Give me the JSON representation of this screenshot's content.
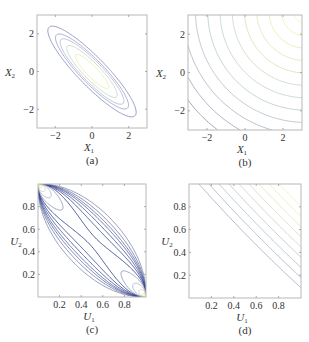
{
  "chart_data": [
    {
      "id": "a",
      "type": "contour",
      "caption": "(a)",
      "xlabel": "X",
      "xlabel_sub": "1",
      "ylabel": "X",
      "ylabel_sub": "2",
      "xlim": [
        -3,
        3
      ],
      "ylim": [
        -3,
        3
      ],
      "xticks": [
        -2,
        0,
        2
      ],
      "yticks": [
        -2,
        0,
        2
      ],
      "xtick_labels": [
        "−2",
        "0",
        "2"
      ],
      "ytick_labels": [
        "−2",
        "0",
        "2"
      ],
      "function": "bivariate normal density, strong negative correlation",
      "correlation": -0.9,
      "levels": [
        0.02,
        0.05,
        0.08,
        0.14,
        0.24
      ],
      "colormap": [
        "#8088b8",
        "#9aa0c8",
        "#b0b8d8",
        "#c8d4c0",
        "#e8f0a8"
      ]
    },
    {
      "id": "b",
      "type": "contour",
      "caption": "(b)",
      "xlabel": "X",
      "xlabel_sub": "1",
      "ylabel": "X",
      "ylabel_sub": "2",
      "xlim": [
        -3,
        3
      ],
      "ylim": [
        -3,
        3
      ],
      "xticks": [
        -2,
        0,
        2
      ],
      "yticks": [
        -2,
        0,
        2
      ],
      "xtick_labels": [
        "−2",
        "0",
        "2"
      ],
      "ytick_labels": [
        "−2",
        "0",
        "2"
      ],
      "function": "contours increasing toward upper-right corner",
      "levels": [
        1,
        2,
        3,
        4,
        5,
        6,
        7,
        8,
        9,
        10,
        11,
        12
      ],
      "colormap": [
        "#8890a8",
        "#98a0b8",
        "#a8b0c0",
        "#b0bcc8",
        "#b8c8c8",
        "#c0d0c8",
        "#c8d8c0",
        "#d4e0b8",
        "#dce8b0",
        "#e4eca8",
        "#eef0a8",
        "#f4f4b0"
      ]
    },
    {
      "id": "c",
      "type": "contour",
      "caption": "(c)",
      "xlabel": "U",
      "xlabel_sub": "1",
      "ylabel": "U",
      "ylabel_sub": "2",
      "xlim": [
        0,
        1
      ],
      "ylim": [
        0,
        1
      ],
      "xticks": [
        0.2,
        0.4,
        0.6,
        0.8
      ],
      "yticks": [
        0.2,
        0.4,
        0.6,
        0.8
      ],
      "xtick_labels": [
        "0.2",
        "0.4",
        "0.6",
        "0.8"
      ],
      "ytick_labels": [
        "0.2",
        "0.4",
        "0.6",
        "0.8"
      ],
      "function": "Gaussian copula density, strong negative dependence (peaks at (0,1) and (1,0))",
      "correlation": -0.9,
      "levels": [
        0.3,
        0.5,
        0.7,
        0.9,
        1.2,
        1.6,
        2.2,
        3,
        4.5,
        7,
        12,
        20
      ],
      "colormap": [
        "#7880a8",
        "#6870a0",
        "#5860a0",
        "#485898",
        "#384890",
        "#283888",
        "#203080",
        "#8890b8",
        "#a8b0c8",
        "#c8d4c0",
        "#e0ec98",
        "#f0f470"
      ]
    },
    {
      "id": "d",
      "type": "contour",
      "caption": "(d)",
      "xlabel": "U",
      "xlabel_sub": "1",
      "ylabel": "U",
      "ylabel_sub": "2",
      "xlim": [
        0,
        1
      ],
      "ylim": [
        0,
        1
      ],
      "xticks": [
        0.2,
        0.4,
        0.6,
        0.8
      ],
      "yticks": [
        0.2,
        0.4,
        0.6,
        0.8
      ],
      "xtick_labels": [
        "0.2",
        "0.4",
        "0.6",
        "0.8"
      ],
      "ytick_labels": [
        "0.2",
        "0.4",
        "0.6",
        "0.8"
      ],
      "function": "near-linear contours increasing toward upper-right corner",
      "levels": [
        1,
        2,
        3,
        4,
        5,
        6,
        7,
        8,
        9
      ],
      "colormap": [
        "#a0a8b8",
        "#a8b0c0",
        "#b0bcc4",
        "#b8c4c4",
        "#c4d0c0",
        "#d0dcb8",
        "#dce4b0",
        "#e8ecb0",
        "#f2f2b8"
      ]
    }
  ]
}
